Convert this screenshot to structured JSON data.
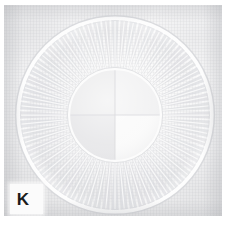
{
  "figure": {
    "label": "K",
    "caption_letter": "K",
    "background_color": "#ffffff"
  },
  "photo": {
    "alt_name": "fabric-photo",
    "cloth_color": "#f2f2f3",
    "cloth_highlight": "#fbfbfb",
    "cloth_shadow": "#e2e2e4",
    "plate": {
      "x": 4,
      "y": 5,
      "width": 218,
      "height": 211
    }
  },
  "artwork": {
    "center": {
      "x": 111,
      "y": 110
    },
    "outer_ring": {
      "name": "outer-ring",
      "radius": 97,
      "stroke_color": "#fdfdfd",
      "shadow_color": "#d8d9dc",
      "stroke_width": 5
    },
    "spokes": {
      "name": "radiating-spokes",
      "count": 64,
      "inner_radius": 46,
      "outer_radius": 95,
      "color": "#d9dade",
      "highlight_color": "#fcfcfc",
      "taper": "wider at outer end"
    },
    "inner_disc": {
      "name": "inner-disc",
      "radius": 46,
      "rim_color": "#fbfbfb",
      "quadrants": [
        {
          "name": "top-left",
          "fill": "#ebebec"
        },
        {
          "name": "top-right",
          "fill": "#f1f1f2"
        },
        {
          "name": "bottom-left",
          "fill": "#e7e7e9"
        },
        {
          "name": "bottom-right",
          "fill": "#fafafa"
        }
      ],
      "divider_color": "#dedee1"
    }
  }
}
